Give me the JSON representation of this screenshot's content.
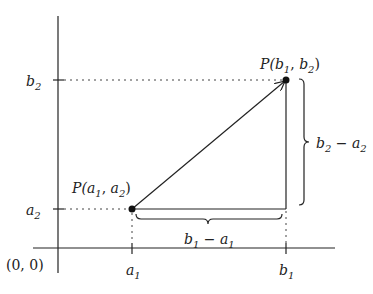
{
  "diagram": {
    "type": "coordinate-geometry",
    "stroke_color": "#222222",
    "background": "#ffffff",
    "origin_label": "(0, 0)",
    "x_ticks": [
      {
        "base": "a",
        "sub": "1"
      },
      {
        "base": "b",
        "sub": "1"
      }
    ],
    "y_ticks": [
      {
        "base": "b",
        "sub": "2"
      },
      {
        "base": "a",
        "sub": "2"
      }
    ],
    "points": [
      {
        "name": "P",
        "x": {
          "base": "a",
          "sub": "1"
        },
        "y": {
          "base": "a",
          "sub": "2"
        },
        "label_prefix": "P(",
        "sep": ", ",
        "suffix": ")"
      },
      {
        "name": "P",
        "x": {
          "base": "b",
          "sub": "1"
        },
        "y": {
          "base": "b",
          "sub": "2"
        },
        "label_prefix": "P(",
        "sep": ", ",
        "suffix": ")"
      }
    ],
    "braces": [
      {
        "orientation": "horizontal",
        "label": {
          "b": "b",
          "b_sub": "1",
          "op": " − ",
          "a": "a",
          "a_sub": "1"
        }
      },
      {
        "orientation": "vertical",
        "label": {
          "b": "b",
          "b_sub": "2",
          "op": " − ",
          "a": "a",
          "a_sub": "2"
        }
      }
    ],
    "arrow": {
      "from": "P(a1,a2)",
      "to": "P(b1,b2)"
    }
  }
}
